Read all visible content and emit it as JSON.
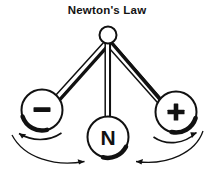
{
  "figure": {
    "title": "Newton's Law",
    "background_color": "#ffffff",
    "ink_color": "#111111",
    "type": "physics-pendulum-diagram"
  },
  "pivot": {
    "name": "pivot",
    "cx": 108,
    "cy": 35,
    "r": 8.5
  },
  "bobs": [
    {
      "id": "negative",
      "label": "–",
      "cx": 42,
      "cy": 110,
      "r": 20.5,
      "shade_side": "lower-left"
    },
    {
      "id": "neutral",
      "label": "N",
      "cx": 108,
      "cy": 137,
      "r": 20.5,
      "shade_side": "lower-right"
    },
    {
      "id": "positive",
      "label": "+",
      "cx": 176,
      "cy": 112,
      "r": 20.5,
      "shade_side": "lower-right"
    }
  ],
  "rods": [
    {
      "id": "rod-left",
      "from": "pivot",
      "to": "negative"
    },
    {
      "id": "rod-center",
      "from": "pivot",
      "to": "neutral"
    },
    {
      "id": "rod-right",
      "from": "pivot",
      "to": "positive"
    }
  ],
  "motion_arrows": [
    {
      "id": "arrow-left-short",
      "direction": "outward-left",
      "position": "below-left-bob"
    },
    {
      "id": "arrow-right-short",
      "direction": "outward-right",
      "position": "below-right-bob"
    },
    {
      "id": "arrow-left-long",
      "direction": "inward-right",
      "position": "bottom-left-sweep"
    },
    {
      "id": "arrow-right-long",
      "direction": "inward-left",
      "position": "bottom-right-sweep"
    }
  ]
}
